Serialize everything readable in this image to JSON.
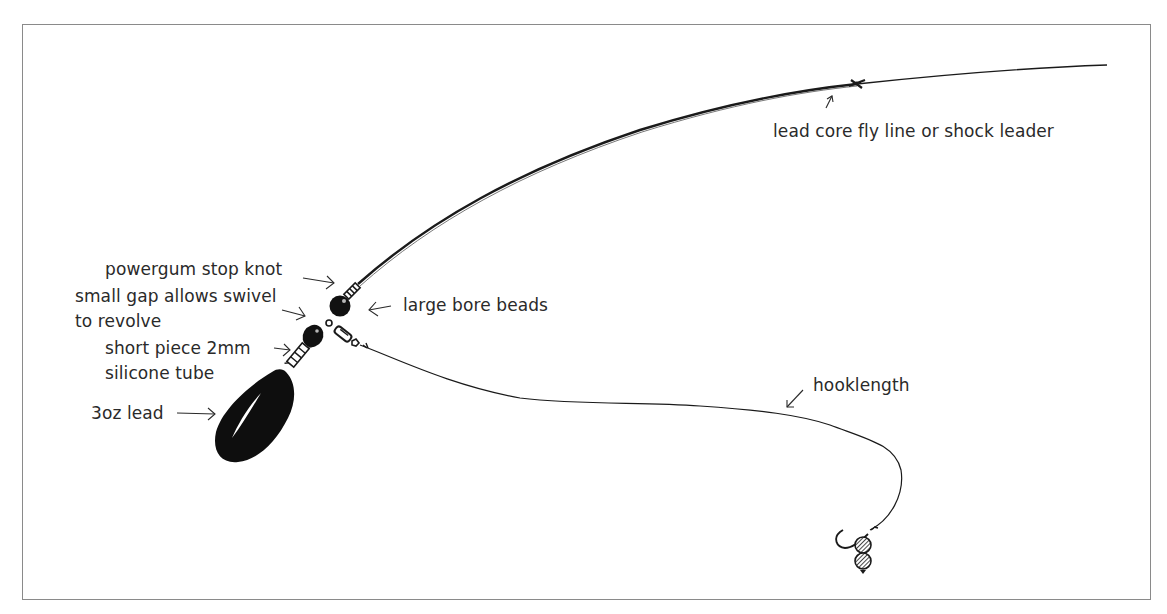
{
  "diagram": {
    "type": "fishing-rig-illustration",
    "labels": {
      "main_line": "lead core fly line or shock leader",
      "stop_knot": "powergum stop knot",
      "gap_line1": "small gap allows swivel",
      "gap_line2": "to revolve",
      "beads": "large bore beads",
      "tube_line1": "short piece 2mm",
      "tube_line2": "silicone tube",
      "lead": "3oz lead",
      "hooklength": "hooklength"
    },
    "colors": {
      "ink": "#1a1a1a",
      "text": "#2a2a2a",
      "frame": "#8a8a8a",
      "background": "#ffffff"
    }
  }
}
